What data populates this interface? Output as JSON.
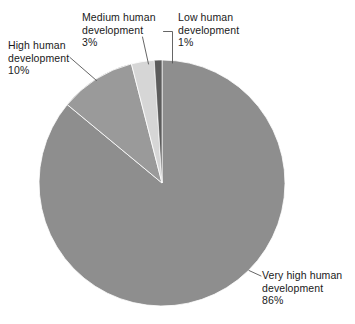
{
  "chart_data": {
    "type": "pie",
    "title": "",
    "subtitle": "",
    "xlabel": "",
    "ylabel": "",
    "legend_position": "callout-labels",
    "grid": false,
    "units": "percent",
    "start_angle_deg": 0,
    "direction": "clockwise",
    "categories": [
      "Very high human development",
      "High human development",
      "Medium human development",
      "Low human development"
    ],
    "values": [
      86,
      10,
      3,
      1
    ],
    "value_labels": [
      "86%",
      "10%",
      "3%",
      "1%"
    ],
    "colors": [
      "#8e8e8e",
      "#9a9a9a",
      "#d6d6d6",
      "#5c5c5c"
    ],
    "slices": [
      {
        "name": "Very high human development",
        "value": 86,
        "value_label": "86%",
        "color": "#8e8e8e",
        "label_lines": [
          "Very high human",
          "development",
          "86%"
        ]
      },
      {
        "name": "High human development",
        "value": 10,
        "value_label": "10%",
        "color": "#9a9a9a",
        "label_lines": [
          "High human",
          "development",
          "10%"
        ]
      },
      {
        "name": "Medium human development",
        "value": 3,
        "value_label": "3%",
        "color": "#d6d6d6",
        "label_lines": [
          "Medium human",
          "development",
          "3%"
        ]
      },
      {
        "name": "Low human development",
        "value": 1,
        "value_label": "1%",
        "color": "#5c5c5c",
        "label_lines": [
          "Low human",
          "development",
          "1%"
        ]
      }
    ]
  },
  "labels": {
    "very_high": {
      "line1": "Very high human",
      "line2": "development",
      "line3": "86%"
    },
    "high": {
      "line1": "High human",
      "line2": "development",
      "line3": "10%"
    },
    "medium": {
      "line1": "Medium human",
      "line2": "development",
      "line3": "3%"
    },
    "low": {
      "line1": "Low human",
      "line2": "development",
      "line3": "1%"
    }
  },
  "style": {
    "background": "#ffffff",
    "text_color": "#1a1a1a",
    "leader_line_color": "#555555",
    "slice_edge_color": "#ffffff"
  }
}
